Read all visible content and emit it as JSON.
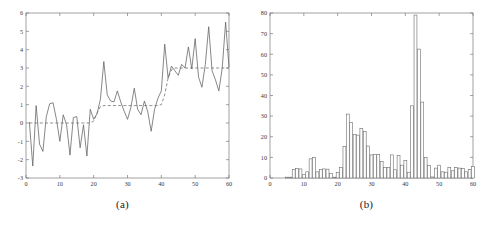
{
  "figure": {
    "background": "#ffffff",
    "axis_color": "#7a7a7a",
    "series_color": "#5f5f5f",
    "dashed_color": "#6e6e6e",
    "bar_edge_color": "#6b6b6b",
    "bar_fill_color": "#ffffff"
  },
  "panels": [
    {
      "id": "a",
      "caption": "(a)"
    },
    {
      "id": "b",
      "caption": "(b)"
    }
  ],
  "chart_data": [
    {
      "type": "line",
      "panel": "(a)",
      "title": "",
      "xlabel": "",
      "ylabel": "",
      "xlim": [
        0,
        60
      ],
      "ylim": [
        -3,
        6
      ],
      "xticks": [
        0,
        10,
        20,
        30,
        40,
        50,
        60
      ],
      "yticks": [
        -3,
        -2,
        -1,
        0,
        1,
        2,
        3,
        4,
        5,
        6
      ],
      "grid": false,
      "legend": "none",
      "series": [
        {
          "name": "observed signal",
          "style": "solid",
          "x": [
            1,
            2,
            3,
            4,
            5,
            6,
            7,
            8,
            9,
            10,
            11,
            12,
            13,
            14,
            15,
            16,
            17,
            18,
            19,
            20,
            21,
            22,
            23,
            24,
            25,
            26,
            27,
            28,
            29,
            30,
            31,
            32,
            33,
            34,
            35,
            36,
            37,
            38,
            39,
            40,
            41,
            42,
            43,
            44,
            45,
            46,
            47,
            48,
            49,
            50,
            51,
            52,
            53,
            54,
            55,
            56,
            57,
            58,
            59,
            60
          ],
          "values": [
            0.05,
            -2.35,
            0.95,
            -1.15,
            -1.55,
            0.35,
            1.05,
            1.1,
            0.2,
            -1.0,
            0.45,
            -0.1,
            -1.75,
            0.3,
            0.35,
            -1.35,
            -0.1,
            -1.8,
            0.75,
            0.2,
            0.5,
            1.3,
            3.35,
            1.55,
            1.2,
            1.15,
            1.75,
            1.15,
            0.65,
            0.2,
            0.85,
            1.9,
            0.75,
            0.45,
            1.2,
            0.6,
            -0.45,
            0.75,
            1.35,
            1.75,
            4.3,
            2.45,
            3.1,
            2.85,
            2.6,
            3.2,
            3.0,
            4.15,
            2.95,
            4.6,
            2.5,
            1.95,
            3.2,
            5.25,
            2.85,
            2.35,
            1.75,
            3.0,
            5.5,
            3.05
          ]
        },
        {
          "name": "piecewise mean",
          "style": "dashed",
          "x": [
            1,
            2,
            3,
            4,
            5,
            6,
            7,
            8,
            9,
            10,
            11,
            12,
            13,
            14,
            15,
            16,
            17,
            18,
            19,
            20,
            21,
            22,
            23,
            24,
            25,
            26,
            27,
            28,
            29,
            30,
            31,
            32,
            33,
            34,
            35,
            36,
            37,
            38,
            39,
            40,
            41,
            42,
            43,
            44,
            45,
            46,
            47,
            48,
            49,
            50,
            51,
            52,
            53,
            54,
            55,
            56,
            57,
            58,
            59,
            60
          ],
          "values": [
            0,
            0,
            0,
            0,
            0,
            0,
            0,
            0,
            0,
            0,
            0,
            0,
            0,
            0,
            0,
            0,
            0,
            0,
            0,
            0.1,
            0.55,
            0.9,
            0.95,
            0.95,
            0.95,
            0.95,
            0.95,
            0.95,
            0.95,
            0.95,
            0.95,
            0.95,
            0.95,
            0.95,
            0.95,
            0.95,
            0.95,
            0.95,
            0.95,
            1.0,
            1.55,
            2.45,
            2.9,
            3.0,
            3.0,
            3.0,
            3.0,
            3.0,
            3.0,
            3.0,
            3.0,
            3.0,
            3.0,
            3.0,
            3.0,
            3.0,
            3.0,
            3.0,
            3.0,
            3.0
          ]
        }
      ]
    },
    {
      "type": "bar",
      "panel": "(b)",
      "title": "",
      "xlabel": "",
      "ylabel": "",
      "xlim": [
        0,
        60
      ],
      "ylim": [
        0,
        80
      ],
      "xticks": [
        0,
        10,
        20,
        30,
        40,
        50,
        60
      ],
      "yticks": [
        0,
        10,
        20,
        30,
        40,
        50,
        60,
        70,
        80
      ],
      "grid": false,
      "legend": "none",
      "categories": [
        1,
        2,
        3,
        4,
        5,
        6,
        7,
        8,
        9,
        10,
        11,
        12,
        13,
        14,
        15,
        16,
        17,
        18,
        19,
        20,
        21,
        22,
        23,
        24,
        25,
        26,
        27,
        28,
        29,
        30,
        31,
        32,
        33,
        34,
        35,
        36,
        37,
        38,
        39,
        40,
        41,
        42,
        43,
        44,
        45,
        46,
        47,
        48,
        49,
        50,
        51,
        52,
        53,
        54,
        55,
        56,
        57,
        58,
        59,
        60
      ],
      "values": [
        0,
        0,
        0,
        0,
        0.4,
        0.4,
        4.2,
        4.6,
        4.4,
        1.6,
        3.0,
        9.3,
        10.0,
        3.0,
        4.2,
        4.4,
        4.3,
        2.2,
        0.4,
        2.6,
        5.0,
        15.2,
        31.0,
        27.0,
        21.0,
        20.8,
        24.0,
        22.5,
        15.5,
        11.2,
        11.5,
        11.5,
        8.0,
        5.1,
        5.0,
        11.2,
        4.0,
        11.0,
        6.2,
        8.5,
        2.8,
        35.0,
        79.0,
        62.5,
        36.8,
        10.0,
        6.0,
        0.5,
        4.8,
        6.2,
        3.0,
        2.8,
        5.0,
        3.5,
        5.0,
        4.8,
        4.6,
        3.0,
        4.2,
        5.6
      ]
    }
  ]
}
